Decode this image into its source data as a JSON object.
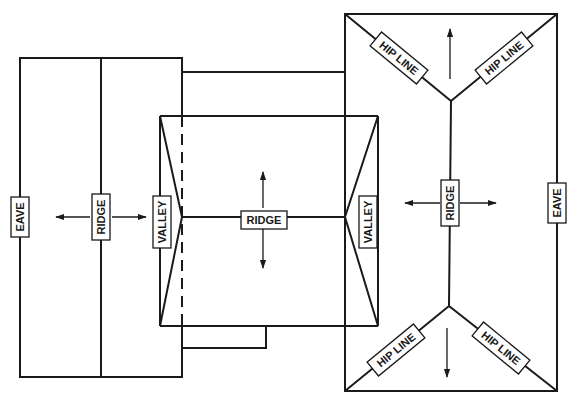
{
  "diagram": {
    "type": "roof-plan",
    "stroke_color": "#1a1a1a",
    "background": "#ffffff",
    "labels": {
      "left_eave": "EAVE",
      "left_ridge": "RIDGE",
      "center_valley_left": "VALLEY",
      "center_ridge": "RIDGE",
      "center_valley_right": "VALLEY",
      "right_ridge": "RIDGE",
      "right_eave": "EAVE",
      "hip_top_left": "HIP LINE",
      "hip_top_right": "HIP LINE",
      "hip_bottom_left": "HIP LINE",
      "hip_bottom_right": "HIP LINE"
    },
    "sections": [
      {
        "name": "left-wing",
        "labels": [
          "EAVE",
          "RIDGE"
        ],
        "arrows": [
          "left",
          "right"
        ]
      },
      {
        "name": "center-wing",
        "labels": [
          "VALLEY",
          "RIDGE",
          "VALLEY"
        ],
        "arrows": [
          "up",
          "down"
        ]
      },
      {
        "name": "right-wing",
        "labels": [
          "HIP LINE",
          "HIP LINE",
          "RIDGE",
          "EAVE",
          "HIP LINE",
          "HIP LINE"
        ],
        "arrows": [
          "up",
          "left",
          "right",
          "down"
        ]
      }
    ]
  }
}
